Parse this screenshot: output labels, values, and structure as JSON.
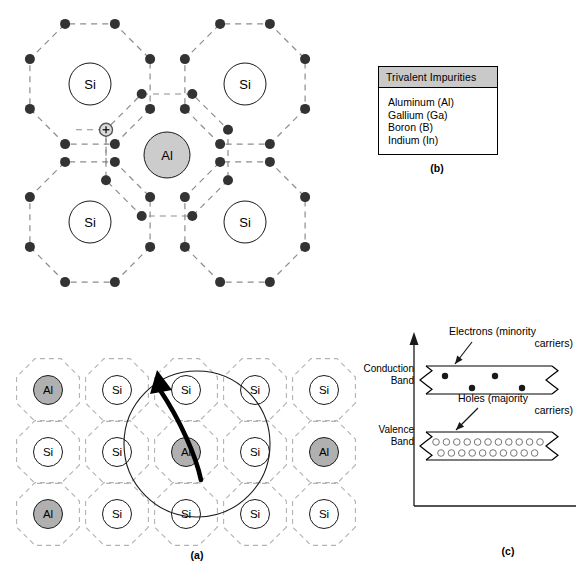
{
  "figure": {
    "panel_labels": {
      "a": "(a)",
      "b": "(b)",
      "c": "(c)"
    }
  },
  "panel_a": {
    "name": "silicon-crystal-lattice-with-aluminum-acceptors",
    "rows": [
      [
        "Al",
        "Si",
        "Si",
        "Si",
        "Si"
      ],
      [
        "Si",
        "Si",
        "Al",
        "Si",
        "Al"
      ],
      [
        "Al",
        "Si",
        "Si",
        "Si",
        "Si"
      ]
    ],
    "atom_labels": {
      "silicon": "Si",
      "aluminum": "Al"
    },
    "colors": {
      "silicon_fill": "#ffffff",
      "aluminum_fill": "#b0b0b0",
      "cell_outline": "#b3b3b3",
      "atom_outline": "#1a1a1a"
    },
    "magnified_center": {
      "row": 1,
      "col": 2
    }
  },
  "panel_b": {
    "header": "Trivalent Impurities",
    "items": [
      "Aluminum (Al)",
      "Gallium (Ga)",
      "Boron (B)",
      "Indium (In)"
    ],
    "colors": {
      "header_fill": "#c9c9c9",
      "border": "#000000"
    }
  },
  "panel_c": {
    "axis_label": "",
    "bands": [
      {
        "name": "Conduction Band",
        "label_lines": [
          "Conduction",
          "Band"
        ]
      },
      {
        "name": "Valence Band",
        "label_lines": [
          "Valence",
          "Band"
        ]
      }
    ],
    "annotations": [
      {
        "name": "electrons-minority",
        "line1": "Electrons (minority",
        "line2": "carriers)"
      },
      {
        "name": "holes-majority",
        "line1": "Holes (majority",
        "line2": "carriers)"
      }
    ],
    "carrier_counts": {
      "conduction_electrons": 4,
      "valence_holes": 21
    },
    "colors": {
      "electron_fill": "#1a1a1a",
      "hole_fill": "#ffffff",
      "hole_stroke": "#777777",
      "band_outline": "#000000"
    }
  },
  "panel_detail": {
    "name": "magnified-aluminum-bonding-detail",
    "center_atom": "Al",
    "neighbor_atoms": [
      "Si",
      "Si",
      "Si",
      "Si"
    ],
    "valence_electrons_per_shell": 8,
    "hole_marker": {
      "symbol": "+",
      "description": "hole-vacancy"
    },
    "colors": {
      "shell_dash": "#8c8c8c",
      "electron_fill": "#333333",
      "aluminum_fill": "#cccccc",
      "silicon_fill": "#ffffff"
    }
  },
  "chart_data": {
    "type": "scatter",
    "ylabel": "Energy",
    "series": [
      {
        "name": "Conduction Band",
        "role": "minority carriers",
        "carrier": "electrons",
        "count": 4
      },
      {
        "name": "Valence Band",
        "role": "majority carriers",
        "carrier": "holes",
        "count": 21
      }
    ]
  }
}
